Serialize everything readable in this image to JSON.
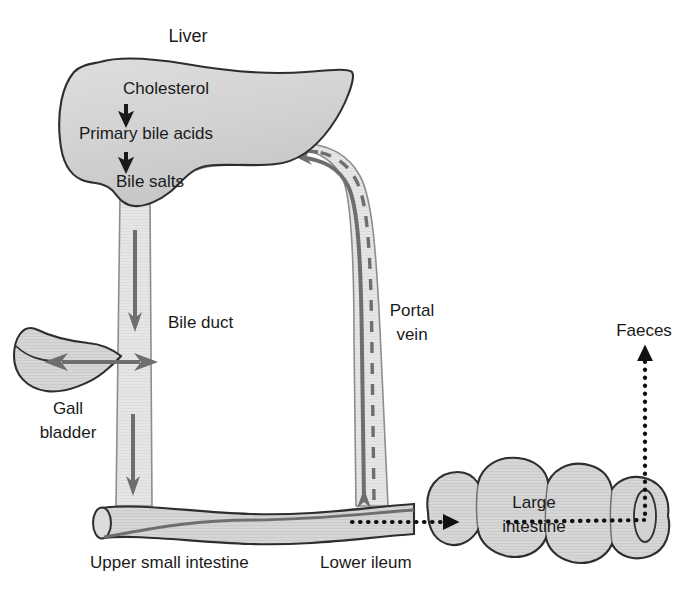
{
  "diagram": {
    "background_color": "#ffffff",
    "organ_fill_color": "#d6d6d6",
    "organ_outline_color": "#2e2e2e",
    "duct_fill_color": "#e4e4e4",
    "arrow_gray_color": "#6e6e6e",
    "arrow_dark_color": "#1a1a1a",
    "dotted_color": "#111111"
  },
  "labels": {
    "liver": "Liver",
    "cholesterol": "Cholesterol",
    "primary_bile_acids": "Primary bile acids",
    "bile_salts": "Bile salts",
    "bile_duct": "Bile duct",
    "gall_bladder_line1": "Gall",
    "gall_bladder_line2": "bladder",
    "portal_vein_line1": "Portal",
    "portal_vein_line2": "vein",
    "upper_small_intestine": "Upper small intestine",
    "lower_ileum": "Lower ileum",
    "large_intestine_line1": "Large",
    "large_intestine_line2": "intestine",
    "faeces": "Faeces"
  },
  "flows": [
    {
      "id": "cholesterol-to-primary",
      "from": "Cholesterol",
      "to": "Primary bile acids",
      "style": "solid-arrow",
      "color": "#1a1a1a"
    },
    {
      "id": "primary-to-bilesalts",
      "from": "Primary bile acids",
      "to": "Bile salts",
      "style": "solid-arrow",
      "color": "#1a1a1a"
    },
    {
      "id": "bile-duct-down-upper",
      "from": "Liver",
      "to": "Bile duct",
      "style": "solid-arrow",
      "color": "#6e6e6e"
    },
    {
      "id": "bile-duct-gallbladder",
      "from": "Bile duct",
      "to": "Gall bladder",
      "style": "double-arrow",
      "color": "#6e6e6e"
    },
    {
      "id": "bile-duct-down-lower",
      "from": "Bile duct",
      "to": "Upper small intestine",
      "style": "solid-arrow",
      "color": "#6e6e6e"
    },
    {
      "id": "portal-vein-up",
      "from": "Lower ileum",
      "to": "Liver",
      "style": "solid-arrow",
      "color": "#6e6e6e"
    },
    {
      "id": "portal-vein-dashed-up",
      "from": "Lower ileum",
      "to": "Primary bile acids",
      "style": "dashed-arrow",
      "color": "#6e6e6e"
    },
    {
      "id": "ileum-to-large-intestine",
      "from": "Lower ileum",
      "to": "Large intestine",
      "style": "dotted-arrow",
      "color": "#111111"
    },
    {
      "id": "large-intestine-to-faeces",
      "from": "Large intestine",
      "to": "Faeces",
      "style": "dotted-arrow",
      "color": "#111111"
    }
  ]
}
